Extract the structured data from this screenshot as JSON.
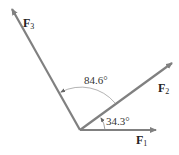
{
  "diagram": {
    "type": "force-vectors",
    "colors": {
      "vector": "#808080",
      "arc": "#a0a0a0",
      "text": "#222222"
    },
    "vectors": [
      {
        "name": "F",
        "sub": "1",
        "angle_deg": 0
      },
      {
        "name": "F",
        "sub": "2",
        "angle_deg": 34.3
      },
      {
        "name": "F",
        "sub": "3",
        "angle_deg": 118.9
      }
    ],
    "angles": [
      {
        "label": "34.3°",
        "between": [
          "F1",
          "F2"
        ]
      },
      {
        "label": "84.6°",
        "between": [
          "F2",
          "F3"
        ]
      }
    ]
  }
}
